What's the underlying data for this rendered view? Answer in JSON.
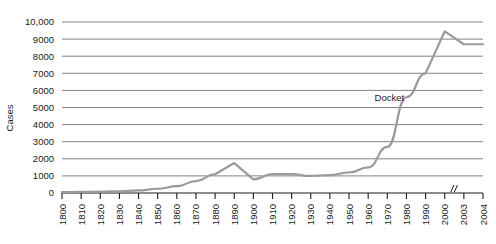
{
  "chart_data": {
    "type": "line",
    "title": "",
    "xlabel": "",
    "ylabel": "Cases",
    "ylim": [
      0,
      10000
    ],
    "ytick_labels": [
      "0",
      "1000",
      "2000",
      "3000",
      "4000",
      "5000",
      "6000",
      "7000",
      "8000",
      "9000",
      "10,000"
    ],
    "ytick_values": [
      0,
      1000,
      2000,
      3000,
      4000,
      5000,
      6000,
      7000,
      8000,
      9000,
      10000
    ],
    "xtick_labels": [
      "1800",
      "1810",
      "1820",
      "1830",
      "1840",
      "1850",
      "1860",
      "1870",
      "1880",
      "1890",
      "1900",
      "1910",
      "1920",
      "1930",
      "1940",
      "1950",
      "1960",
      "1970",
      "1980",
      "1990",
      "2000",
      "2003",
      "2004"
    ],
    "axis_break_after": "2000",
    "axis_break_symbol": "//",
    "grid": "horizontal",
    "legend": "none",
    "annotations": [
      {
        "text": "Docket",
        "x": "1975",
        "y": 5400
      }
    ],
    "series": [
      {
        "name": "Docket",
        "color": "#9a9a9a",
        "x": [
          "1800",
          "1810",
          "1820",
          "1830",
          "1840",
          "1850",
          "1860",
          "1870",
          "1880",
          "1890",
          "1900",
          "1910",
          "1920",
          "1930",
          "1940",
          "1950",
          "1960",
          "1970",
          "1980",
          "1990",
          "2000",
          "2003",
          "2004"
        ],
        "values": [
          50,
          60,
          80,
          100,
          150,
          250,
          400,
          700,
          1100,
          1750,
          800,
          1100,
          1100,
          1000,
          1050,
          1200,
          1500,
          2700,
          5600,
          7000,
          9450,
          8700,
          8700
        ]
      }
    ]
  },
  "axis": {
    "y_title": "Cases"
  }
}
